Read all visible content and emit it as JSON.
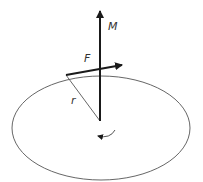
{
  "diagram": {
    "labels": {
      "moment": "M",
      "force": "F",
      "radius": "r"
    },
    "elements": {
      "disk": {
        "shape": "ellipse",
        "cx": 101,
        "cy": 128,
        "rx": 89,
        "ry": 52
      },
      "moment_axis": {
        "from": [
          100,
          121
        ],
        "to": [
          100,
          10
        ]
      },
      "force_vector": {
        "from": [
          66,
          75
        ],
        "to": [
          123,
          65
        ]
      },
      "radius_line": {
        "from": [
          66,
          75
        ],
        "to": [
          100,
          121
        ]
      },
      "rotation_arrow": {
        "center": [
          101,
          133
        ],
        "direction": "clockwise-viewed-from-top"
      }
    },
    "colors": {
      "stroke": "#1a1a1a",
      "thin_stroke": "#555555",
      "label": "#333333",
      "background": "#ffffff"
    }
  }
}
